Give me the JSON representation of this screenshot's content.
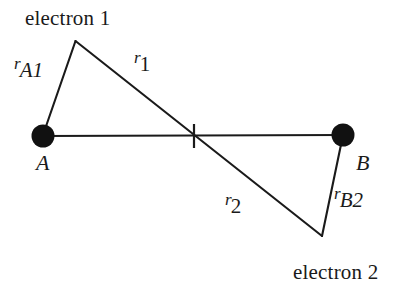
{
  "figure": {
    "background_color": "#ffffff",
    "stroke_color": "#1a1a1a",
    "width": 403,
    "height": 292
  },
  "labels": {
    "electron1": "electron 1",
    "electron2": "electron 2",
    "nucleus_a": "A",
    "nucleus_b": "B",
    "r_a1_var": "r",
    "r_a1_sub": "A1",
    "r_1_var": "r",
    "r_1_sub": "1",
    "r_2_var": "r",
    "r_2_sub": "2",
    "r_b2_var": "r",
    "r_b2_sub": "B2"
  },
  "nodes": [
    {
      "name": "nucleus-a",
      "label": "A",
      "x": 43,
      "y": 136,
      "radius": 11,
      "fill": "#111111"
    },
    {
      "name": "nucleus-b",
      "label": "B",
      "x": 343,
      "y": 135,
      "radius": 11,
      "fill": "#111111"
    },
    {
      "name": "electron-1",
      "label": "electron 1",
      "x": 75,
      "y": 41
    },
    {
      "name": "electron-2",
      "label": "electron 2",
      "x": 322,
      "y": 236
    },
    {
      "name": "midpoint-tick",
      "label": "",
      "x": 194,
      "y": 136
    }
  ],
  "segments": [
    {
      "name": "segment-a-to-b",
      "label": "",
      "x1": 43,
      "y1": 136,
      "x2": 343,
      "y2": 135
    },
    {
      "name": "segment-r-a1",
      "label": "rA1",
      "x1": 43,
      "y1": 136,
      "x2": 75,
      "y2": 41
    },
    {
      "name": "segment-r1-r2",
      "label": "r1 r2",
      "x1": 75,
      "y1": 41,
      "x2": 322,
      "y2": 236
    },
    {
      "name": "segment-r-b2",
      "label": "rB2",
      "x1": 343,
      "y1": 135,
      "x2": 322,
      "y2": 236
    }
  ],
  "tick": {
    "name": "midpoint-tick",
    "x": 194,
    "y_top": 124,
    "y_bottom": 148
  }
}
